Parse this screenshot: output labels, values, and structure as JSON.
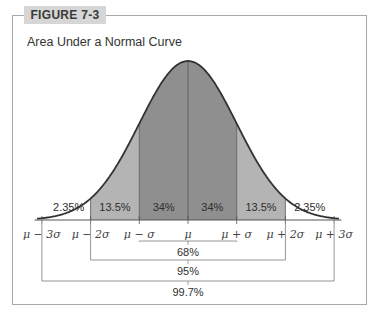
{
  "figure": {
    "label": "FIGURE 7-3",
    "title": "Area Under a Normal Curve"
  },
  "colors": {
    "frame": "#a9a9a9",
    "tab_bg": "#d6d6d6",
    "band1": "#8f8f8f",
    "band2": "#b4b4b4",
    "tail": "#ffffff",
    "curve": "#333333"
  },
  "chart_data": {
    "type": "area",
    "title": "Area Under a Normal Curve",
    "distribution": "normal",
    "x_ticks": [
      "μ − 3σ",
      "μ − 2σ",
      "μ − σ",
      "μ",
      "μ + σ",
      "μ + 2σ",
      "μ + 3σ"
    ],
    "x_range_sigma": [
      -3,
      3
    ],
    "regions": [
      {
        "from": -3,
        "to": -2,
        "label": "2.35%",
        "shade": "tail"
      },
      {
        "from": -2,
        "to": -1,
        "label": "13.5%",
        "shade": "band2"
      },
      {
        "from": -1,
        "to": 0,
        "label": "34%",
        "shade": "band1"
      },
      {
        "from": 0,
        "to": 1,
        "label": "34%",
        "shade": "band1"
      },
      {
        "from": 1,
        "to": 2,
        "label": "13.5%",
        "shade": "band2"
      },
      {
        "from": 2,
        "to": 3,
        "label": "2.35%",
        "shade": "tail"
      }
    ],
    "brackets": [
      {
        "from": -1,
        "to": 1,
        "label": "68%"
      },
      {
        "from": -2,
        "to": 2,
        "label": "95%"
      },
      {
        "from": -3,
        "to": 3,
        "label": "99.7%"
      }
    ]
  }
}
